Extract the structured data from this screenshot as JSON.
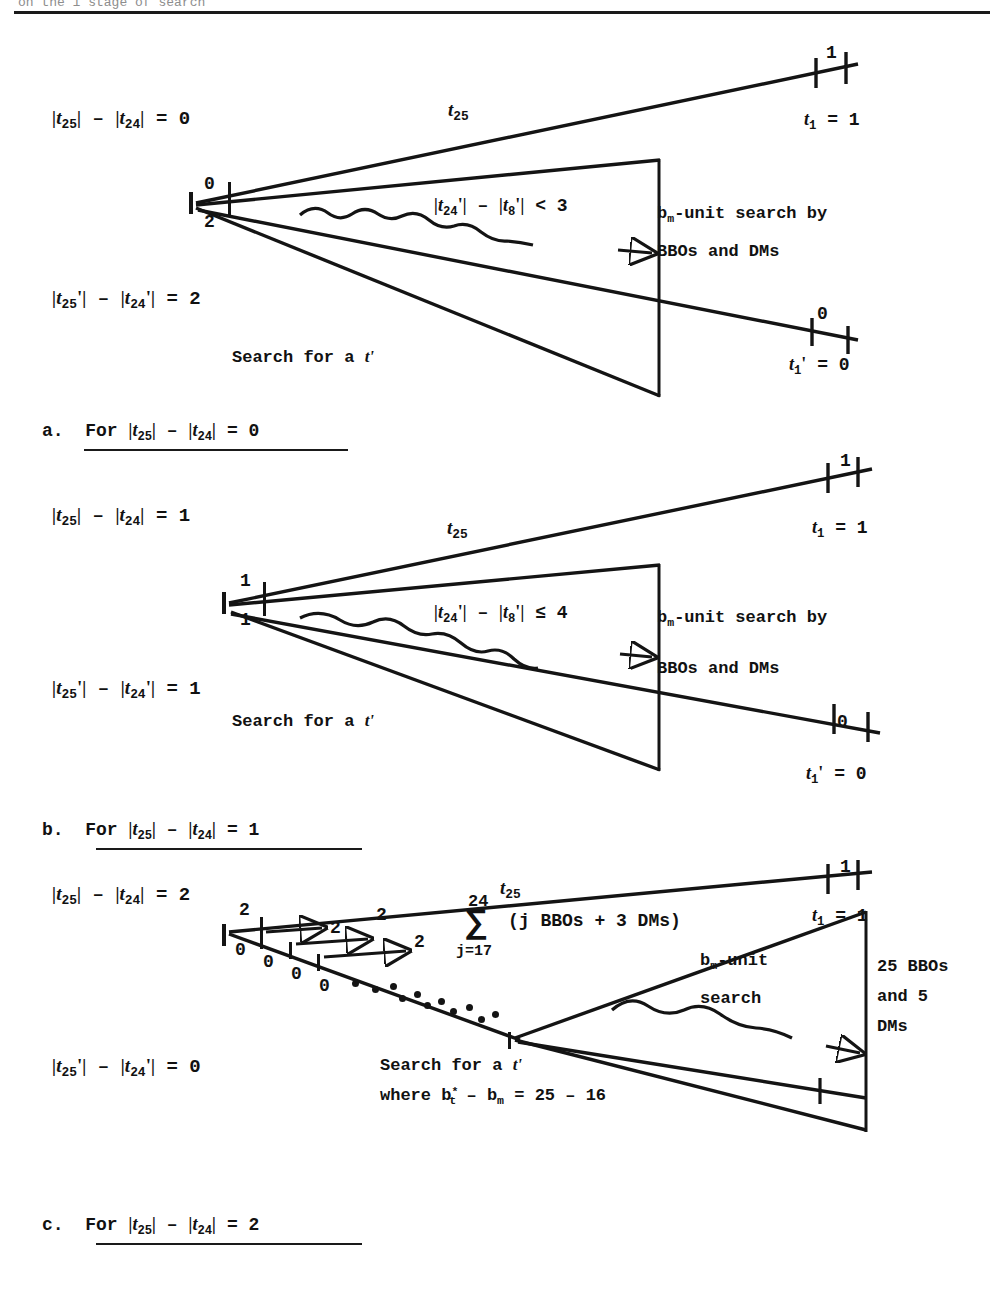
{
  "page": {
    "header_partial": "on the 1 stage of search",
    "figure_type": "search-tree diagrams"
  },
  "panels": [
    {
      "id": "a",
      "left_labels": {
        "top": "|t₂₅| − |t₂₄| = 0",
        "bottom": "|t'₂₅| − |t'₂₄| = 2"
      },
      "node_labels": {
        "upper": "0",
        "lower": "2"
      },
      "branch_label": "t₂₅",
      "inequality": "|t'₂₄| − |t'₈| < 3",
      "search_note_line1": "bₘ-unit search by",
      "search_note_line2": "BBOs and DMs",
      "search_caption": "Search for a t'",
      "endpoint_top_tick": "1",
      "endpoint_top": "t₁ = 1",
      "endpoint_bottom_tick": "0",
      "endpoint_bottom": "t'₁ = 0",
      "caption": "a.  For |t₂₅| − |t₂₄| = 0"
    },
    {
      "id": "b",
      "left_labels": {
        "top": "|t₂₅| − |t₂₄| = 1",
        "bottom": "|t'₂₅| − |t'₂₄| = 1"
      },
      "node_labels": {
        "upper": "1",
        "lower": "1"
      },
      "branch_label": "t₂₅",
      "inequality": "|t'₂₄| − |t'₈| ≤ 4",
      "search_note_line1": "bₘ-unit search by",
      "search_note_line2": "BBOs and DMs",
      "search_caption": "Search for a t'",
      "endpoint_top_tick": "1",
      "endpoint_top": "t₁ = 1",
      "endpoint_bottom_tick": "0",
      "endpoint_bottom": "t'₁ = 0",
      "caption": "b.  For |t₂₅| − |t₂₄| = 1"
    },
    {
      "id": "c",
      "left_labels": {
        "top": "|t₂₅| − |t₂₄| = 2",
        "bottom": "|t'₂₅| − |t'₂₄| = 0"
      },
      "branch_label": "t₂₅",
      "upper_step_labels": [
        "2",
        "2",
        "2",
        "2"
      ],
      "lower_step_labels": [
        "0",
        "0",
        "0",
        "0"
      ],
      "summation": {
        "upper_limit": "24",
        "sigma": "∑",
        "lower_limit": "j=17",
        "body": "(j BBOs + 3 DMs)"
      },
      "search_note_line1": "bₘ-unit",
      "search_note_line2": "search",
      "right_note_line1": "25 BBOs",
      "right_note_line2": "and 5",
      "right_note_line3": "DMs",
      "search_caption_line1": "Search for a t'",
      "search_caption_line2": "where b*ₜ − bₘ = 25 − 16",
      "endpoint_top_tick": "1",
      "endpoint_top": "t₁ = 1",
      "caption": "c.  For |t₂₅| − |t₂₄| = 2"
    }
  ]
}
